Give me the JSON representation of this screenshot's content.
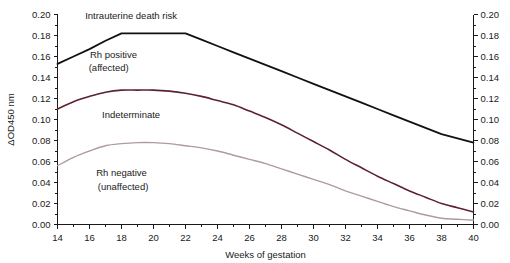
{
  "chart_data": {
    "type": "line",
    "title": "",
    "xlabel": "Weeks of gestation",
    "ylabel": "ΔOD450 nm",
    "xlim": [
      14,
      40
    ],
    "ylim": [
      0.0,
      0.2
    ],
    "xticks": [
      14,
      16,
      18,
      20,
      22,
      24,
      26,
      28,
      30,
      32,
      34,
      36,
      38,
      40
    ],
    "xtick_labels": [
      "14",
      "16",
      "18",
      "20",
      "22",
      "24",
      "26",
      "28",
      "30",
      "32",
      "34",
      "36",
      "38",
      "40"
    ],
    "yticks": [
      0.0,
      0.02,
      0.04,
      0.06,
      0.08,
      0.1,
      0.12,
      0.14,
      0.16,
      0.18,
      0.2
    ],
    "ytick_labels": [
      "0.00",
      "0.02",
      "0.04",
      "0.06",
      "0.08",
      "0.10",
      "0.12",
      "0.14",
      "0.16",
      "0.18",
      "0.20"
    ],
    "y_minor_step": 0.01,
    "grid": false,
    "legend": "none",
    "dual_y_axis": true,
    "series": [
      {
        "name": "upper-boundary",
        "color": "#111111",
        "width": 1.8,
        "x": [
          14,
          15,
          16,
          17,
          18,
          19,
          20,
          21,
          22,
          23,
          24,
          25,
          26,
          27,
          28,
          29,
          30,
          31,
          32,
          33,
          34,
          35,
          36,
          37,
          38,
          39,
          40
        ],
        "y": [
          0.153,
          0.16,
          0.167,
          0.175,
          0.182,
          0.182,
          0.182,
          0.182,
          0.182,
          0.176,
          0.17,
          0.164,
          0.158,
          0.152,
          0.146,
          0.14,
          0.134,
          0.128,
          0.122,
          0.116,
          0.11,
          0.104,
          0.098,
          0.092,
          0.086,
          0.082,
          0.078
        ]
      },
      {
        "name": "middle-boundary",
        "color": "#5c2230",
        "width": 1.6,
        "x": [
          14,
          15,
          16,
          17,
          18,
          19,
          20,
          21,
          22,
          23,
          24,
          25,
          26,
          27,
          28,
          29,
          30,
          31,
          32,
          33,
          34,
          35,
          36,
          37,
          38,
          39,
          40
        ],
        "y": [
          0.11,
          0.117,
          0.122,
          0.126,
          0.128,
          0.128,
          0.128,
          0.127,
          0.125,
          0.122,
          0.118,
          0.114,
          0.108,
          0.102,
          0.095,
          0.087,
          0.079,
          0.071,
          0.062,
          0.054,
          0.046,
          0.039,
          0.032,
          0.026,
          0.02,
          0.016,
          0.012
        ]
      },
      {
        "name": "lower-boundary",
        "color": "#b09aa2",
        "width": 1.4,
        "x": [
          14,
          15,
          16,
          17,
          18,
          19,
          20,
          21,
          22,
          23,
          24,
          25,
          26,
          27,
          28,
          29,
          30,
          31,
          32,
          33,
          34,
          35,
          36,
          37,
          38,
          39,
          40
        ],
        "y": [
          0.056,
          0.064,
          0.07,
          0.075,
          0.077,
          0.078,
          0.078,
          0.077,
          0.075,
          0.073,
          0.07,
          0.066,
          0.062,
          0.058,
          0.053,
          0.048,
          0.043,
          0.038,
          0.032,
          0.027,
          0.022,
          0.017,
          0.013,
          0.009,
          0.006,
          0.005,
          0.004
        ]
      }
    ],
    "annotations": [
      {
        "name": "intrauterine-death-risk",
        "text": "Intrauterine death risk",
        "x": 18.6,
        "y": 0.196,
        "anchor": "middle"
      },
      {
        "name": "rh-positive-affected-line1",
        "text": "Rh positive",
        "x": 17.5,
        "y": 0.159,
        "anchor": "middle"
      },
      {
        "name": "rh-positive-affected-line2",
        "text": "(affected)",
        "x": 17.2,
        "y": 0.146,
        "anchor": "middle"
      },
      {
        "name": "indeterminate",
        "text": "Indeterminate",
        "x": 18.6,
        "y": 0.101,
        "anchor": "middle"
      },
      {
        "name": "rh-negative-unaffected-line1",
        "text": "Rh negative",
        "x": 18.0,
        "y": 0.046,
        "anchor": "middle"
      },
      {
        "name": "rh-negative-unaffected-line2",
        "text": "(unaffected)",
        "x": 18.1,
        "y": 0.033,
        "anchor": "middle"
      }
    ]
  },
  "colors": {
    "background": "#ffffff",
    "axis": "#1a1a1a",
    "upper_curve": "#111111",
    "middle_curve": "#5c2230",
    "lower_curve": "#b09aa2",
    "text": "#1a1a1a"
  }
}
